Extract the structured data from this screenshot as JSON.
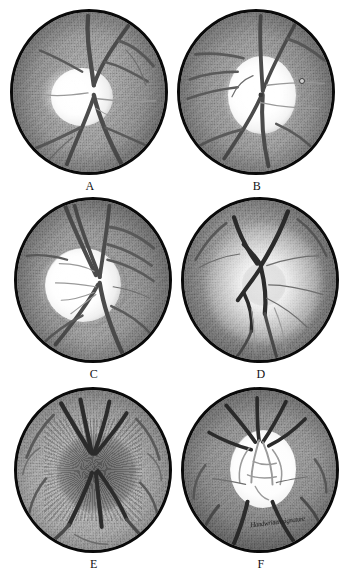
{
  "figure": {
    "kind": "fundus-photograph-plate",
    "layout": {
      "rows": 3,
      "cols": 2,
      "total_panels": 6
    },
    "background_color": "#ffffff",
    "rim_color": "#0a0a0a",
    "palette": {
      "retina_mid": "#9d9d9d",
      "retina_dark": "#6d6d6d",
      "disc_bright": "#ffffff",
      "vessel_dark": "#2b2b2b",
      "vessel_mid": "#5a5a5a"
    }
  },
  "panels": [
    {
      "id": "A",
      "label": "A",
      "description": "Optic disc with bright temporal crescent and branching retinal vessels",
      "disc_tone": "bright",
      "mark": null
    },
    {
      "id": "B",
      "label": "B",
      "description": "Large pale excavated optic disc with vessels bending at the rim",
      "disc_tone": "bright",
      "mark": {
        "name": "small-round-lesion",
        "x": 119,
        "y": 66
      }
    },
    {
      "id": "C",
      "label": "C",
      "description": "Enlarged pale cupped disc displaced nasally with vessel bundle at temporal margin",
      "disc_tone": "bright",
      "mark": null
    },
    {
      "id": "D",
      "label": "D",
      "description": "Disc with radiating peripapillary halo and converging dark vessel trunks",
      "disc_tone": "halo",
      "mark": null
    },
    {
      "id": "E",
      "label": "E",
      "description": "Swollen dark elevated disc with blurred margins and radiating striations",
      "disc_tone": "swollen",
      "mark": null
    },
    {
      "id": "F",
      "label": "F",
      "description": "Pale white atrophic disc with fine vessels on its surface and dark surrounding retina",
      "disc_tone": "pale",
      "mark": null,
      "signature": "Handwritten signature"
    }
  ]
}
